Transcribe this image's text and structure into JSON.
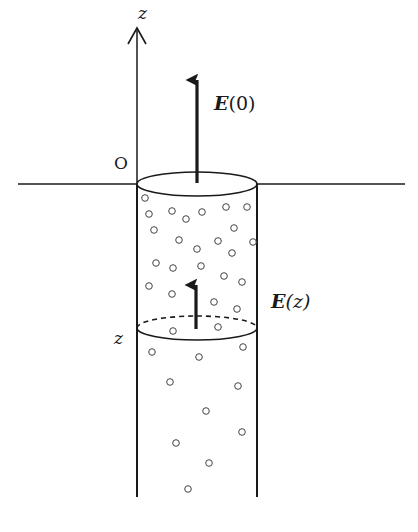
{
  "diagram": {
    "axis": {
      "label": "z",
      "origin_label": "O"
    },
    "labels": {
      "field_top_symbol": "E",
      "field_top_arg": "(0)",
      "field_depth_symbol": "E",
      "field_depth_arg": "(z)",
      "depth_marker": "z"
    },
    "colors": {
      "stroke": "#1a1a1a",
      "background": "#ffffff",
      "particle": "#444444"
    },
    "particles": [
      [
        145,
        198
      ],
      [
        149,
        214
      ],
      [
        172,
        211
      ],
      [
        186,
        219
      ],
      [
        202,
        212
      ],
      [
        226,
        207
      ],
      [
        247,
        207
      ],
      [
        154,
        230
      ],
      [
        234,
        228
      ],
      [
        179,
        240
      ],
      [
        218,
        241
      ],
      [
        253,
        242
      ],
      [
        197,
        249
      ],
      [
        232,
        253
      ],
      [
        156,
        263
      ],
      [
        173,
        268
      ],
      [
        201,
        266
      ],
      [
        224,
        276
      ],
      [
        242,
        282
      ],
      [
        149,
        286
      ],
      [
        172,
        294
      ],
      [
        214,
        302
      ],
      [
        237,
        309
      ],
      [
        173,
        331
      ],
      [
        218,
        327
      ],
      [
        152,
        352
      ],
      [
        199,
        357
      ],
      [
        243,
        347
      ],
      [
        170,
        382
      ],
      [
        238,
        386
      ],
      [
        206,
        411
      ],
      [
        242,
        432
      ],
      [
        176,
        443
      ],
      [
        209,
        463
      ],
      [
        188,
        489
      ]
    ]
  }
}
